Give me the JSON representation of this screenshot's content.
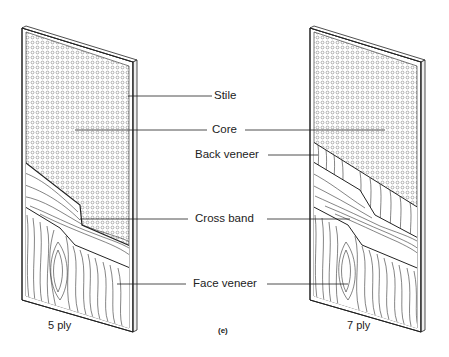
{
  "figure": {
    "label": "(e)",
    "panels": [
      {
        "id": "left",
        "caption": "5 ply"
      },
      {
        "id": "right",
        "caption": "7 ply"
      }
    ],
    "labels": {
      "stile": "Stile",
      "core": "Core",
      "back_veneer": "Back veneer",
      "cross_band": "Cross band",
      "face_veneer": "Face veneer"
    },
    "colors": {
      "line": "#222222",
      "background": "#ffffff",
      "dots": "#555555"
    }
  }
}
